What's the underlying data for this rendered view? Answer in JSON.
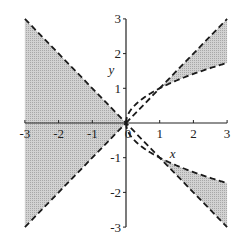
{
  "chart_data": {
    "type": "area",
    "title": "",
    "xlabel": "x",
    "ylabel": "y",
    "xlim": [
      -3,
      3
    ],
    "ylim": [
      -3,
      3
    ],
    "x_ticks": [
      "-3",
      "-2",
      "-1",
      "0",
      "1",
      "2",
      "3"
    ],
    "y_ticks": [
      "3",
      "2",
      "1",
      "-1",
      "-2",
      "-3"
    ],
    "grid": false,
    "legend": null,
    "series": [
      {
        "name": "y = x",
        "style": "dashed",
        "x": [
          -3,
          3
        ],
        "y": [
          -3,
          3
        ]
      },
      {
        "name": "y = -x",
        "style": "dashed",
        "x": [
          -3,
          3
        ],
        "y": [
          3,
          -3
        ]
      },
      {
        "name": "y = sqrt(x)",
        "style": "dashed",
        "x": [
          0,
          1,
          2,
          3
        ],
        "y": [
          0,
          1,
          1.414,
          1.732
        ]
      },
      {
        "name": "y = -sqrt(x)",
        "style": "dashed",
        "x": [
          0,
          1,
          2,
          3
        ],
        "y": [
          0,
          -1,
          -1.414,
          -1.732
        ]
      }
    ],
    "shaded_regions": [
      {
        "description": "left wedge between y=-x and y=x for x<0",
        "x_range": [
          -3,
          0
        ]
      },
      {
        "description": "between y=sqrt(x) and y=x for x>1",
        "x_range": [
          1,
          3
        ]
      },
      {
        "description": "between y=-x and y=-sqrt(x) for x>1",
        "x_range": [
          1,
          3
        ]
      }
    ]
  },
  "colors": {
    "shade": "#c8c8c8",
    "line": "#1a1a1a",
    "axis": "#222222"
  }
}
